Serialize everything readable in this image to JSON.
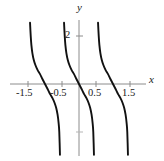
{
  "figure": {
    "axis_labels": {
      "x": "x",
      "y": "y"
    },
    "y_tick_labels": [
      {
        "value": 2,
        "text": "2"
      }
    ],
    "x_tick_labels": [
      {
        "value": -1.5,
        "text": "-1.5"
      },
      {
        "value": -0.5,
        "text": "-0.5"
      },
      {
        "value": 0.5,
        "text": "0.5"
      },
      {
        "value": 1.5,
        "text": "1.5"
      }
    ],
    "colors": {
      "curve": "#111111",
      "axis": "#8c8c8c",
      "text": "#1a1a1a",
      "background": "#ffffff"
    }
  },
  "chart_data": {
    "type": "line",
    "title": "",
    "xlabel": "x",
    "ylabel": "y",
    "xlim": [
      -2.1,
      1.95
    ],
    "ylim": [
      -3.0,
      2.6
    ],
    "grid": false,
    "legend": null,
    "x_ticks": [
      -1.5,
      -0.5,
      0.5,
      1.5
    ],
    "x_tick_labels": [
      "-1.5",
      "-0.5",
      "0.5",
      "1.5"
    ],
    "y_ticks": [
      2,
      -2
    ],
    "y_tick_labels": [
      "2",
      ""
    ],
    "series": [
      {
        "name": "branch-left",
        "zero_crossing": -1,
        "asymptotes": [
          -1.5,
          -0.5
        ],
        "points": [
          [
            -1.44,
            2.55
          ],
          [
            -1.42,
            2.0
          ],
          [
            -1.4,
            1.62
          ],
          [
            -1.37,
            1.28
          ],
          [
            -1.33,
            1.0
          ],
          [
            -1.28,
            0.78
          ],
          [
            -1.22,
            0.59
          ],
          [
            -1.15,
            0.42
          ],
          [
            -1.08,
            0.22
          ],
          [
            -1.0,
            0.0
          ],
          [
            -0.92,
            -0.22
          ],
          [
            -0.85,
            -0.42
          ],
          [
            -0.78,
            -0.59
          ],
          [
            -0.72,
            -0.78
          ],
          [
            -0.67,
            -1.0
          ],
          [
            -0.63,
            -1.28
          ],
          [
            -0.6,
            -1.62
          ],
          [
            -0.58,
            -2.0
          ],
          [
            -0.56,
            -2.95
          ]
        ]
      },
      {
        "name": "branch-middle",
        "zero_crossing": 0,
        "asymptotes": [
          -0.5,
          0.5
        ],
        "points": [
          [
            -0.44,
            2.55
          ],
          [
            -0.42,
            2.0
          ],
          [
            -0.4,
            1.62
          ],
          [
            -0.37,
            1.28
          ],
          [
            -0.33,
            1.0
          ],
          [
            -0.28,
            0.78
          ],
          [
            -0.22,
            0.59
          ],
          [
            -0.15,
            0.42
          ],
          [
            -0.08,
            0.22
          ],
          [
            0.0,
            0.0
          ],
          [
            0.08,
            -0.22
          ],
          [
            0.15,
            -0.42
          ],
          [
            0.22,
            -0.59
          ],
          [
            0.28,
            -0.78
          ],
          [
            0.33,
            -1.0
          ],
          [
            0.37,
            -1.28
          ],
          [
            0.4,
            -1.62
          ],
          [
            0.42,
            -2.0
          ],
          [
            0.44,
            -2.95
          ]
        ]
      },
      {
        "name": "branch-right",
        "zero_crossing": 1,
        "asymptotes": [
          0.5,
          1.5
        ],
        "points": [
          [
            0.56,
            2.55
          ],
          [
            0.58,
            2.0
          ],
          [
            0.6,
            1.62
          ],
          [
            0.63,
            1.28
          ],
          [
            0.67,
            1.0
          ],
          [
            0.72,
            0.78
          ],
          [
            0.78,
            0.59
          ],
          [
            0.85,
            0.42
          ],
          [
            0.92,
            0.22
          ],
          [
            1.0,
            0.0
          ],
          [
            1.08,
            -0.22
          ],
          [
            1.15,
            -0.42
          ],
          [
            1.22,
            -0.59
          ],
          [
            1.28,
            -0.78
          ],
          [
            1.33,
            -1.0
          ],
          [
            1.37,
            -1.28
          ],
          [
            1.4,
            -1.62
          ],
          [
            1.42,
            -2.0
          ],
          [
            1.44,
            -2.95
          ]
        ]
      }
    ]
  }
}
